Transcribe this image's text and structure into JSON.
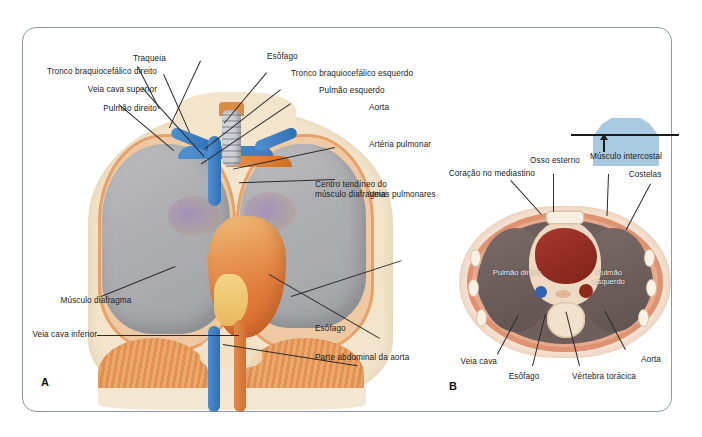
{
  "figure": {
    "panels": [
      {
        "letter": "A",
        "name": "panel-a-anterior-thorax"
      },
      {
        "letter": "B",
        "name": "panel-b-transverse-section"
      }
    ]
  },
  "panel_a": {
    "labels": {
      "traqueia": "Traqueia",
      "esofago_top": "Esôfago",
      "tronco_braquiocefalico_direito": "Tronco braquiocefálico direito",
      "tronco_braquiocefalico_esquerdo": "Tronco braquiocefálico esquerdo",
      "veia_cava_superior": "Veia cava superior",
      "pulmao_esquerdo": "Pulmão esquerdo",
      "pulmao_direito": "Pulmão direito",
      "aorta": "Aorta",
      "arteria_pulmonar": "Artéria pulmonar",
      "veias_pulmonares": "Veias pulmonares",
      "musculo_diafragma": "Músculo diafragma",
      "veia_cava_inferior": "Veia cava inferior",
      "centro_tendineo": "Centro tendíneo do músculo diafragma",
      "esofago_bottom": "Esôfago",
      "parte_abdominal_aorta": "Parte abdominal da aorta"
    }
  },
  "panel_b": {
    "labels": {
      "coracao_no_mediastino": "Coração no mediastino",
      "osso_esterno": "Osso esterno",
      "musculo_intercostal": "Músculo intercostal",
      "costelas": "Costelas",
      "veia_cava": "Veia cava",
      "esofago": "Esôfago",
      "vertebra_toracica": "Vértebra torácica",
      "aorta": "Aorta",
      "pulmao_direito": "Pulmão direito",
      "pulmao_esquerdo": "Pulmão esquerdo"
    },
    "orientation_icon": "torso-section-level-icon"
  },
  "colors": {
    "frame_border": "#8a99a8",
    "body_silhouette": "#f2e3c9",
    "lung_gray": "#a9acb3",
    "vein_blue": "#2f6fb5",
    "artery_orange": "#d3712f",
    "heart_red": "#8e2a1c",
    "diaphragm_orange": "#e29253",
    "chest_wall_pink": "#e8a98c",
    "orientation_blue": "#a8c9e0",
    "label_text": "#1b1b1b"
  }
}
